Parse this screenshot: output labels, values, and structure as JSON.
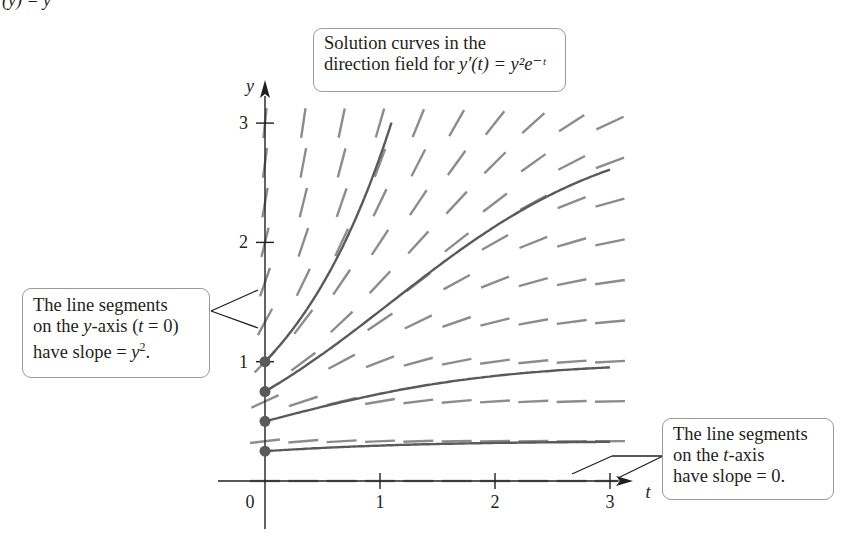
{
  "clipped_header_fragment": "(y) = y",
  "chart_data": {
    "type": "direction-field",
    "equation": "y'(t) = y^2 e^{-t}",
    "xlabel": "t",
    "ylabel": "y",
    "x_ticks": [
      0,
      1,
      2,
      3
    ],
    "y_ticks": [
      1,
      2,
      3
    ],
    "x_tick_labels": [
      "0",
      "1",
      "2",
      "3"
    ],
    "y_tick_labels": [
      "1",
      "2",
      "3"
    ],
    "xlim": [
      -0.4,
      3.2
    ],
    "ylim": [
      -0.6,
      3.4
    ],
    "field_grid": {
      "t_min": 0,
      "t_max": 3,
      "t_step": 0.3333,
      "y_min": 0,
      "y_max": 3,
      "y_step": 0.3333
    },
    "solution_curves": [
      {
        "initial_y": 1.0,
        "formula": "y = e^t",
        "t_end": 1.1
      },
      {
        "initial_y": 0.75,
        "formula": "y = 1/(1/3 + e^-t)",
        "t_end": 3.0
      },
      {
        "initial_y": 0.5,
        "formula": "y = 1/(1 + e^-t)",
        "t_end": 3.0
      },
      {
        "initial_y": 0.25,
        "formula": "y = 1/(3 + e^-t)",
        "t_end": 3.0
      }
    ],
    "initial_points": [
      [
        0,
        1.0
      ],
      [
        0,
        0.75
      ],
      [
        0,
        0.5
      ],
      [
        0,
        0.25
      ]
    ],
    "colors": {
      "axis": "#231f20",
      "segment": "#8c8c8c",
      "curve": "#5a5a5a",
      "point": "#5a5a5a"
    },
    "grid": false
  },
  "callouts": {
    "title": {
      "line1": "Solution curves in the",
      "line2_prefix": "direction field for ",
      "line2_math": "y′(t) = y²e⁻ᵗ"
    },
    "y_axis_note": {
      "line1": "The line segments",
      "line2_prefix": "on the ",
      "line2_var": "y",
      "line2_suffix": "-axis (",
      "line2_var2": "t",
      "line2_end": " = 0)",
      "line3_prefix": "have slope = ",
      "line3_var": "y",
      "line3_sup": "2",
      "line3_end": "."
    },
    "t_axis_note": {
      "line1": "The line segments",
      "line2_prefix": "on the ",
      "line2_var": "t",
      "line2_suffix": "-axis",
      "line3": "have slope = 0."
    }
  }
}
